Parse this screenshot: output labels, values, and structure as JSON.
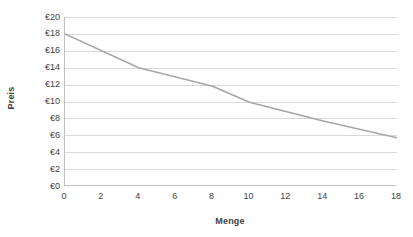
{
  "chart_data": {
    "type": "line",
    "title": "",
    "xlabel": "Menge",
    "ylabel": "Preis",
    "xlim": [
      0,
      18
    ],
    "ylim": [
      0,
      20
    ],
    "grid": "horizontal",
    "legend": "none",
    "line_color": "#a6a6a6",
    "x_tick_labels": [
      "0",
      "2",
      "4",
      "6",
      "8",
      "10",
      "12",
      "14",
      "16",
      "18"
    ],
    "x_tick_values": [
      0,
      2,
      4,
      6,
      8,
      10,
      12,
      14,
      16,
      18
    ],
    "y_tick_labels": [
      "€0",
      "€2",
      "€4",
      "€6",
      "€8",
      "€10",
      "€12",
      "€14",
      "€16",
      "€18",
      "€20"
    ],
    "y_tick_values": [
      0,
      2,
      4,
      6,
      8,
      10,
      12,
      14,
      16,
      18,
      20
    ],
    "series": [
      {
        "name": "Nachfrage",
        "x": [
          0,
          4,
          8,
          10,
          14,
          18
        ],
        "values": [
          18.0,
          14.0,
          11.8,
          9.9,
          7.7,
          5.7
        ]
      }
    ]
  },
  "axes": {
    "y_title": "Preis",
    "x_title": "Menge"
  }
}
